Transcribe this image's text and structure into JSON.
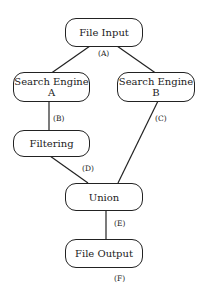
{
  "diagram": {
    "nodes": [
      {
        "id": "file_input",
        "label": "File Input"
      },
      {
        "id": "search_a",
        "label": "Search Engine A"
      },
      {
        "id": "search_b",
        "label": "Search Engine B"
      },
      {
        "id": "filtering",
        "label": "Filtering"
      },
      {
        "id": "union",
        "label": "Union"
      },
      {
        "id": "file_output",
        "label": "File Output"
      }
    ],
    "edge_labels": {
      "A": "(A)",
      "B": "(B)",
      "C": "(C)",
      "D": "(D)",
      "E": "(E)",
      "F": "(F)"
    },
    "edges": [
      {
        "from": "file_input",
        "to": "search_a"
      },
      {
        "from": "file_input",
        "to": "search_b"
      },
      {
        "from": "search_a",
        "to": "filtering",
        "label": "(B)"
      },
      {
        "from": "search_b",
        "to": "union",
        "label": "(C)"
      },
      {
        "from": "filtering",
        "to": "union",
        "label": "(D)"
      },
      {
        "from": "union",
        "to": "file_output",
        "label": "(E)"
      }
    ]
  }
}
